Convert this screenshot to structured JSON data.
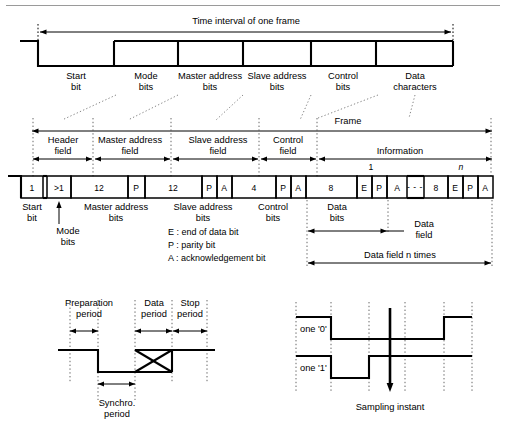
{
  "figure": {
    "top_rule_visible": true
  },
  "top_waveform": {
    "span_label": "Time interval of one frame",
    "segments": [
      {
        "label_line1": "Start",
        "label_line2": "bit"
      },
      {
        "label_line1": "Mode",
        "label_line2": "bits"
      },
      {
        "label_line1": "Master address",
        "label_line2": "bits"
      },
      {
        "label_line1": "Slave address",
        "label_line2": "bits"
      },
      {
        "label_line1": "Control",
        "label_line2": "bits"
      },
      {
        "label_line1": "Data",
        "label_line2": "characters"
      }
    ]
  },
  "frame": {
    "span_label": "Frame",
    "fields": [
      {
        "line1": "Header",
        "line2": "field"
      },
      {
        "line1": "Master address",
        "line2": "field"
      },
      {
        "line1": "Slave address",
        "line2": "field"
      },
      {
        "line1": "Control",
        "line2": "field"
      },
      {
        "line1": "Information",
        "line2": ""
      }
    ],
    "information_indices": {
      "first": "1",
      "last": "n"
    },
    "cells": [
      {
        "value": "1"
      },
      {
        "value": ">1"
      },
      {
        "value": "12"
      },
      {
        "value": "P"
      },
      {
        "value": "12"
      },
      {
        "value": "P"
      },
      {
        "value": "A"
      },
      {
        "value": "4"
      },
      {
        "value": "P"
      },
      {
        "value": "A"
      },
      {
        "value": "8"
      },
      {
        "value": "E"
      },
      {
        "value": "P"
      },
      {
        "value": "A"
      },
      {
        "value": "8"
      },
      {
        "value": "E"
      },
      {
        "value": "P"
      },
      {
        "value": "A"
      }
    ],
    "ellipsis": "- - -",
    "bit_labels": [
      {
        "line1": "Start",
        "line2": "bit"
      },
      {
        "line1": "Mode",
        "line2": "bits"
      },
      {
        "line1": "Master address",
        "line2": "bits"
      },
      {
        "line1": "Slave address",
        "line2": "bits"
      },
      {
        "line1": "Control",
        "line2": "bits"
      },
      {
        "line1": "Data",
        "line2": "bits"
      },
      {
        "line1": "Data",
        "line2": "field"
      }
    ],
    "legend": [
      "E : end of data bit",
      "P : parity bit",
      "A : acknowledgement bit"
    ],
    "data_field_span_label": "Data field n times"
  },
  "bottom_left_diagram": {
    "name": "bit-timing-periods",
    "labels": [
      {
        "line1": "Preparation",
        "line2": "period"
      },
      {
        "line1": "Data",
        "line2": "period"
      },
      {
        "line1": "Stop",
        "line2": "period"
      },
      {
        "line1": "Synchro.",
        "line2": "period"
      }
    ]
  },
  "bottom_right_diagram": {
    "name": "zero-one-sampling",
    "trace_labels": [
      "one '0'",
      "one '1'"
    ],
    "sampling_label": "Sampling instant"
  },
  "colors": {
    "ink": "#000000",
    "background": "#ffffff",
    "rule": "#9a9a9a",
    "dotted_connector": "#777777"
  }
}
